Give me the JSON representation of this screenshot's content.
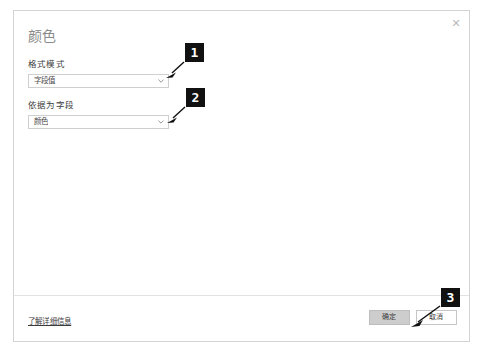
{
  "dialog": {
    "title": "颜色",
    "close_icon": "close-icon",
    "close_glyph": "✕"
  },
  "fields": [
    {
      "label": "格式模式",
      "value": "字段值",
      "chevron_icon": "chevron-down-icon"
    },
    {
      "label": "依据为字段",
      "value": "颜色",
      "chevron_icon": "chevron-down-icon"
    }
  ],
  "footer": {
    "help_link": "了解详细信息",
    "ok_label": "确定",
    "cancel_label": "取消"
  },
  "annotations": [
    {
      "id": "1",
      "label": "1"
    },
    {
      "id": "2",
      "label": "2"
    },
    {
      "id": "3",
      "label": "3"
    }
  ],
  "colors": {
    "badge_bg": "#111111",
    "badge_fg": "#ffffff",
    "dialog_border": "#d4d4d4",
    "title_text": "#8a8a8a",
    "primary_button_bg": "#cdcdcd"
  },
  "bottom_sliver": "​"
}
